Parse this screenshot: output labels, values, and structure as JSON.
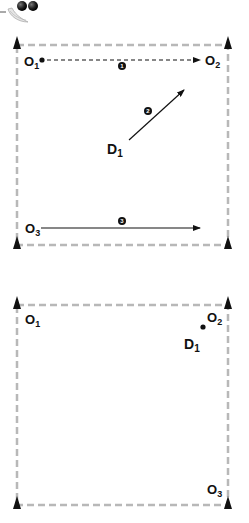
{
  "colors": {
    "ink": "#111111",
    "frame": "#b8b8b8",
    "badge": "#111111",
    "ball": "#2a2a2a"
  },
  "header": {
    "icon": "balls-icon"
  },
  "diagram_top": {
    "labels": {
      "o1": "O",
      "o1_sub": "1",
      "o2": "O",
      "o2_sub": "2",
      "o3": "O",
      "o3_sub": "3",
      "d1": "D",
      "d1_sub": "1"
    },
    "badges": {
      "b1": "1",
      "b2": "2",
      "b3": "3"
    },
    "movements": [
      {
        "step": "1",
        "from": "O1",
        "to": "O2",
        "style": "dashed"
      },
      {
        "step": "2",
        "from": "D1",
        "to": "diagonal",
        "style": "solid"
      },
      {
        "step": "3",
        "from": "O3",
        "to": "right",
        "style": "solid"
      }
    ]
  },
  "diagram_bottom": {
    "labels": {
      "o1": "O",
      "o1_sub": "1",
      "o2": "O",
      "o2_sub": "2",
      "o3": "O",
      "o3_sub": "3",
      "d1": "D",
      "d1_sub": "1"
    }
  }
}
